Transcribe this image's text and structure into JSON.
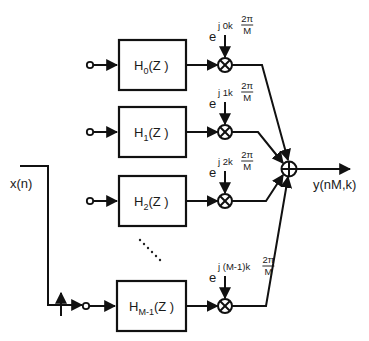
{
  "diagram": {
    "input_label": "x(n)",
    "output_label": "y(nM,k)",
    "filters": [
      {
        "name": "H",
        "sub": "0",
        "arg": "(Z )"
      },
      {
        "name": "H",
        "sub": "1",
        "arg": "(Z )"
      },
      {
        "name": "H",
        "sub": "2",
        "arg": "(Z )"
      },
      {
        "name": "H",
        "sub": "M-1",
        "arg": "(Z )"
      }
    ],
    "modulators": [
      {
        "base": "e",
        "exponent": "j 0k",
        "frac_num": "2π",
        "frac_den": "M"
      },
      {
        "base": "e",
        "exponent": "j 1k",
        "frac_num": "2π",
        "frac_den": "M"
      },
      {
        "base": "e",
        "exponent": "j 2k",
        "frac_num": "2π",
        "frac_den": "M"
      },
      {
        "base": "e",
        "exponent": "j (M-1)k",
        "frac_num": "2π",
        "frac_den": "M"
      }
    ],
    "ellipsis": "......",
    "icons": {
      "multiplier": "circled-times-icon",
      "summer": "circled-plus-icon",
      "commutator": "up-arrow-icon",
      "input-tap": "open-circle-icon"
    }
  }
}
